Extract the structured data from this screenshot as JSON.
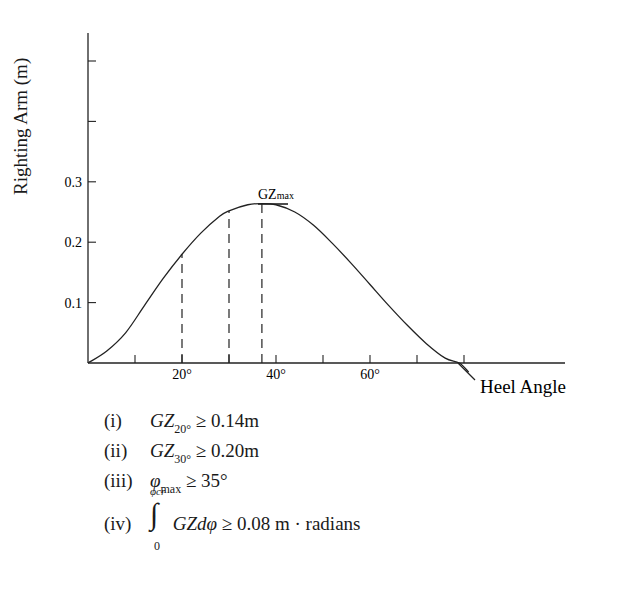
{
  "chart_data": {
    "type": "line",
    "title": "",
    "xlabel": "Heel Angle",
    "ylabel": "Righting Arm (m)",
    "xlim": [
      0,
      100
    ],
    "ylim": [
      0,
      0.55
    ],
    "x_tick_values": [
      10,
      20,
      30,
      40,
      50,
      60,
      70,
      80
    ],
    "x_tick_labels": [
      "",
      "20°",
      "",
      "40°",
      "",
      "60°",
      "",
      ""
    ],
    "y_tick_values": [
      0.1,
      0.2,
      0.3,
      0.4,
      0.5
    ],
    "y_tick_labels": [
      "0.1",
      "0.2",
      "0.3",
      "",
      ""
    ],
    "grid": false,
    "series": [
      {
        "name": "GZ curve",
        "x": [
          0,
          4,
          8,
          12,
          16,
          20,
          24,
          28,
          30,
          34,
          37,
          40,
          44,
          48,
          52,
          56,
          60,
          64,
          68,
          72,
          76,
          79,
          81
        ],
        "y": [
          0,
          0.02,
          0.05,
          0.095,
          0.14,
          0.18,
          0.215,
          0.243,
          0.252,
          0.262,
          0.264,
          0.262,
          0.25,
          0.228,
          0.198,
          0.165,
          0.13,
          0.095,
          0.062,
          0.032,
          0.008,
          0.0,
          -0.015
        ]
      }
    ],
    "reference_lines": [
      {
        "type": "vertical-dashed",
        "x": 20,
        "y_top": 0.18
      },
      {
        "type": "vertical-dashed",
        "x": 30,
        "y_top": 0.252
      },
      {
        "type": "vertical-dashed",
        "x": 37,
        "y_top": 0.264
      }
    ],
    "annotations": [
      {
        "text": "GZmax",
        "x": 37,
        "y": 0.264
      }
    ]
  },
  "labels": {
    "y_axis": "Righting Arm (m)",
    "x_axis": "Heel Angle",
    "gz_max_main": "GZ",
    "gz_max_sub": "max"
  },
  "criteria": [
    {
      "num": "(i)",
      "lhs": "GZ",
      "sub": "20°",
      "rhs": "≥ 0.14m"
    },
    {
      "num": "(ii)",
      "lhs": "GZ",
      "sub": "30°",
      "rhs": "≥ 0.20m"
    },
    {
      "num": "(iii)",
      "lhs": "φ",
      "sub": "max",
      "rhs": "≥ 35°"
    },
    {
      "num": "(iv)",
      "int_upper": "φcr",
      "int_lower": "0",
      "lhs": "GZdφ",
      "rhs": "≥ 0.08 m · radians"
    }
  ]
}
